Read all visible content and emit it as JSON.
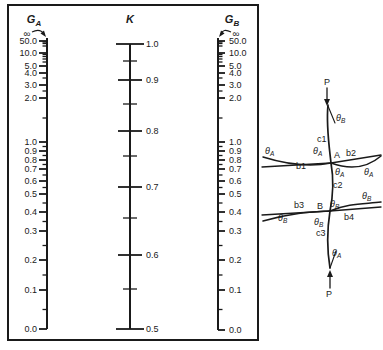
{
  "figure": {
    "background": "#ffffff",
    "line_color": "#1a1a1a"
  },
  "chart_data": {
    "type": "nomograph-alignment-chart",
    "scales": [
      {
        "id": "GA",
        "header": {
          "main": "G",
          "sub": "A"
        },
        "infinity_label": "∞",
        "x": 47,
        "top": 38,
        "bottom": 329,
        "label_side": "left",
        "major_ticks": [
          {
            "v": "50.0",
            "y": 41
          },
          {
            "v": "10.0",
            "y": 53
          },
          {
            "v": "5.0",
            "y": 66
          },
          {
            "v": "4.0",
            "y": 73
          },
          {
            "v": "3.0",
            "y": 85
          },
          {
            "v": "2.0",
            "y": 98
          },
          {
            "v": "1.0",
            "y": 142
          },
          {
            "v": "0.9",
            "y": 151
          },
          {
            "v": "0.8",
            "y": 160
          },
          {
            "v": "0.7",
            "y": 169
          },
          {
            "v": "0.6",
            "y": 181
          },
          {
            "v": "0.5",
            "y": 194
          },
          {
            "v": "0.4",
            "y": 212
          },
          {
            "v": "0.3",
            "y": 231
          },
          {
            "v": "0.2",
            "y": 260
          },
          {
            "v": "0.1",
            "y": 290
          },
          {
            "v": "0.0",
            "y": 329
          }
        ],
        "minor_ticks": [
          {
            "v": "40",
            "y": 42
          },
          {
            "v": "30",
            "y": 43.5
          },
          {
            "v": "20",
            "y": 46
          },
          {
            "v": "9",
            "y": 54.5
          },
          {
            "v": "8",
            "y": 56.5
          },
          {
            "v": "7",
            "y": 59
          },
          {
            "v": "6",
            "y": 62
          },
          {
            "v": "3.5",
            "y": 78
          },
          {
            "v": "2.5",
            "y": 91
          },
          {
            "v": "1.5",
            "y": 118
          },
          {
            "v": "0.95",
            "y": 146.5
          },
          {
            "v": "0.85",
            "y": 155.5
          },
          {
            "v": "0.75",
            "y": 164.5
          },
          {
            "v": "0.65",
            "y": 175
          },
          {
            "v": "0.55",
            "y": 187.5
          },
          {
            "v": "0.45",
            "y": 203
          },
          {
            "v": "0.35",
            "y": 221.5
          },
          {
            "v": "0.25",
            "y": 245.5
          },
          {
            "v": "0.15",
            "y": 275
          },
          {
            "v": "0.05",
            "y": 309.5
          }
        ]
      },
      {
        "id": "K",
        "header": {
          "main": "K",
          "sub": ""
        },
        "x": 130,
        "top": 44,
        "bottom": 329,
        "label_side": "right",
        "major_ticks": [
          {
            "v": "1.0",
            "y": 44
          },
          {
            "v": "0.9",
            "y": 80
          },
          {
            "v": "0.8",
            "y": 131
          },
          {
            "v": "0.7",
            "y": 187
          },
          {
            "v": "0.6",
            "y": 255
          },
          {
            "v": "0.5",
            "y": 329
          }
        ],
        "minor_ticks": [
          {
            "v": "0.95",
            "y": 61
          },
          {
            "v": "0.85",
            "y": 104
          },
          {
            "v": "0.75",
            "y": 156
          },
          {
            "v": "0.65",
            "y": 218
          },
          {
            "v": "0.55",
            "y": 289
          }
        ]
      },
      {
        "id": "GB",
        "header": {
          "main": "G",
          "sub": "B"
        },
        "infinity_label": "∞",
        "x": 218,
        "top": 38,
        "bottom": 330,
        "label_side": "right",
        "major_ticks": [
          {
            "v": "50.0",
            "y": 41
          },
          {
            "v": "10.0",
            "y": 53
          },
          {
            "v": "5.0",
            "y": 66
          },
          {
            "v": "4.0",
            "y": 73
          },
          {
            "v": "3.0",
            "y": 85
          },
          {
            "v": "2.0",
            "y": 98
          },
          {
            "v": "1.0",
            "y": 142
          },
          {
            "v": "0.9",
            "y": 151
          },
          {
            "v": "0.8",
            "y": 160
          },
          {
            "v": "0.7",
            "y": 169
          },
          {
            "v": "0.6",
            "y": 181
          },
          {
            "v": "0.5",
            "y": 194
          },
          {
            "v": "0.4",
            "y": 212
          },
          {
            "v": "0.3",
            "y": 231
          },
          {
            "v": "0.2",
            "y": 260
          },
          {
            "v": "0.1",
            "y": 290
          },
          {
            "v": "0.0",
            "y": 330
          }
        ],
        "minor_ticks": [
          {
            "v": "40",
            "y": 42
          },
          {
            "v": "30",
            "y": 43.5
          },
          {
            "v": "20",
            "y": 46
          },
          {
            "v": "9",
            "y": 54.5
          },
          {
            "v": "8",
            "y": 56.5
          },
          {
            "v": "7",
            "y": 59
          },
          {
            "v": "6",
            "y": 62
          },
          {
            "v": "3.5",
            "y": 78
          },
          {
            "v": "2.5",
            "y": 91
          },
          {
            "v": "1.5",
            "y": 118
          },
          {
            "v": "0.95",
            "y": 146.5
          },
          {
            "v": "0.85",
            "y": 155.5
          },
          {
            "v": "0.75",
            "y": 164.5
          },
          {
            "v": "0.65",
            "y": 175
          },
          {
            "v": "0.55",
            "y": 187.5
          },
          {
            "v": "0.45",
            "y": 203
          },
          {
            "v": "0.35",
            "y": 221.5
          },
          {
            "v": "0.25",
            "y": 245.5
          },
          {
            "v": "0.15",
            "y": 275
          },
          {
            "v": "0.05",
            "y": 309.5
          }
        ]
      }
    ]
  },
  "diagram": {
    "labels": [
      {
        "t": "P",
        "x": 327,
        "y": 85,
        "anchor": "middle"
      },
      {
        "t": "θ",
        "sub": "B",
        "x": 336,
        "y": 121
      },
      {
        "t": "c1",
        "x": 317,
        "y": 142
      },
      {
        "t": "θ",
        "sub": "A",
        "x": 265,
        "y": 154
      },
      {
        "t": "θ",
        "sub": "A",
        "x": 313,
        "y": 154
      },
      {
        "t": "A",
        "x": 334,
        "y": 158
      },
      {
        "t": "b2",
        "x": 346,
        "y": 156
      },
      {
        "t": "b1",
        "x": 296,
        "y": 169
      },
      {
        "t": "θ",
        "sub": "A",
        "x": 335,
        "y": 175
      },
      {
        "t": "θ",
        "sub": "A",
        "x": 364,
        "y": 175
      },
      {
        "t": "c2",
        "x": 333,
        "y": 188
      },
      {
        "t": "θ",
        "sub": "B",
        "x": 362,
        "y": 199
      },
      {
        "t": "b3",
        "x": 294,
        "y": 208
      },
      {
        "t": "B",
        "x": 317,
        "y": 209
      },
      {
        "t": "θ",
        "sub": "B",
        "x": 330,
        "y": 207
      },
      {
        "t": "θ",
        "sub": "B",
        "x": 278,
        "y": 221
      },
      {
        "t": "θ",
        "sub": "B",
        "x": 314,
        "y": 225
      },
      {
        "t": "b4",
        "x": 344,
        "y": 220
      },
      {
        "t": "c3",
        "x": 316,
        "y": 236
      },
      {
        "t": "θ",
        "sub": "A",
        "x": 332,
        "y": 256
      },
      {
        "t": "P",
        "x": 329,
        "y": 297,
        "anchor": "middle"
      }
    ]
  }
}
